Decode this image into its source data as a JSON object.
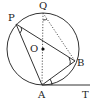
{
  "diagram": {
    "type": "circle-geometry",
    "circle": {
      "center_label": "O",
      "cx": 43,
      "cy": 49,
      "r": 36
    },
    "points": {
      "Q": {
        "label": "Q",
        "x": 43,
        "y": 13
      },
      "P": {
        "label": "P",
        "x": 16,
        "y": 24
      },
      "B": {
        "label": "B",
        "x": 75,
        "y": 61
      },
      "A": {
        "label": "A",
        "x": 42,
        "y": 85
      },
      "T": {
        "label": "T",
        "x": 89,
        "y": 85
      }
    },
    "segments_solid": [
      "PB",
      "PA",
      "AB",
      "AT"
    ],
    "segments_dotted": [
      "QA",
      "QB"
    ],
    "angle_marks": [
      "P",
      "B",
      "A (between AB and AT)",
      "Q"
    ],
    "labels": {
      "Q": "Q",
      "P": "P",
      "O": "O",
      "B": "B",
      "A": "A",
      "T": "T"
    }
  }
}
